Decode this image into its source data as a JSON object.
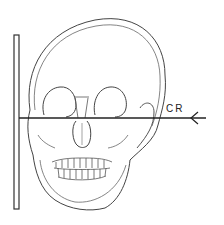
{
  "diagram": {
    "labels": {
      "central_ray": "CR"
    },
    "elements": [
      {
        "name": "image-receptor",
        "description": "vertical plate on left side"
      },
      {
        "name": "skull",
        "description": "frontal skull outline with orbits, nasal cavity, teeth, mandible"
      },
      {
        "name": "central-ray",
        "description": "horizontal arrow from right pointing left, passing through orbits"
      }
    ],
    "colors": {
      "line": "#333333",
      "background": "#ffffff"
    }
  }
}
